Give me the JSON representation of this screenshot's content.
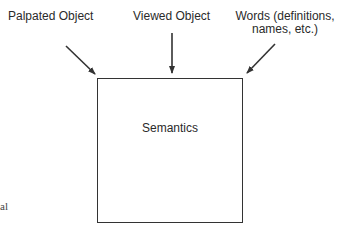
{
  "diagram": {
    "inputs": [
      {
        "id": "palpated",
        "label": "Palpated Object"
      },
      {
        "id": "viewed",
        "label": "Viewed Object"
      },
      {
        "id": "words",
        "label_line1": "Words (definitions,",
        "label_line2": "names, etc.)"
      }
    ],
    "center_box": {
      "label": "Semantics"
    },
    "edge_fragment": "al",
    "colors": {
      "stroke": "#333333",
      "text": "#2a2a2a",
      "background": "#ffffff"
    }
  }
}
